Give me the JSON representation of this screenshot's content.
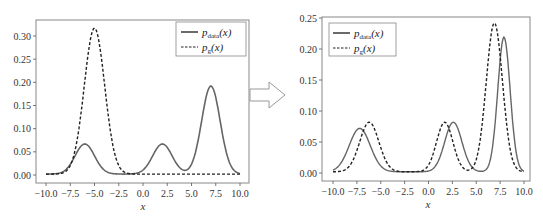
{
  "chart_data": [
    {
      "type": "line",
      "title": "",
      "xlabel": "x",
      "ylabel": "",
      "xlim": [
        -10.0,
        10.0
      ],
      "ylim": [
        0.0,
        0.3
      ],
      "xticks": [
        "-10.0",
        "-7.5",
        "-5.0",
        "-2.5",
        "0.0",
        "2.5",
        "5.0",
        "7.5",
        "10.0"
      ],
      "yticks": [
        "0.00",
        "0.05",
        "0.10",
        "0.15",
        "0.20",
        "0.25",
        "0.30"
      ],
      "grid": false,
      "legend_position": "upper right",
      "series": [
        {
          "name": "p_data(x)",
          "style": "solid",
          "color": "#555555",
          "components": [
            {
              "mean": -6.0,
              "peak": 0.065
            },
            {
              "mean": 2.0,
              "peak": 0.065
            },
            {
              "mean": 7.0,
              "peak": 0.19
            }
          ],
          "sample_points": [
            [
              -10,
              0
            ],
            [
              -7.5,
              0.02
            ],
            [
              -6,
              0.065
            ],
            [
              -4,
              0.01
            ],
            [
              -2.5,
              0.0
            ],
            [
              0,
              0.005
            ],
            [
              2,
              0.065
            ],
            [
              4.2,
              0.013
            ],
            [
              7,
              0.19
            ],
            [
              10,
              0.003
            ]
          ]
        },
        {
          "name": "p_g(x)",
          "style": "dashed",
          "color": "#222222",
          "components": [
            {
              "mean": -5.0,
              "peak": 0.315
            }
          ],
          "sample_points": [
            [
              -10,
              0
            ],
            [
              -7.5,
              0.03
            ],
            [
              -5,
              0.315
            ],
            [
              -2.5,
              0.02
            ],
            [
              -1.5,
              0.003
            ],
            [
              0,
              0.003
            ],
            [
              10,
              0.003
            ]
          ]
        }
      ]
    },
    {
      "type": "line",
      "title": "",
      "xlabel": "x",
      "ylabel": "",
      "xlim": [
        -10.0,
        10.0
      ],
      "ylim": [
        0.0,
        0.25
      ],
      "xticks": [
        "-10.0",
        "-7.5",
        "-5.0",
        "-2.5",
        "0.0",
        "2.5",
        "5.0",
        "7.5",
        "10.0"
      ],
      "yticks": [
        "0.00",
        "0.05",
        "0.10",
        "0.15",
        "0.20",
        "0.25"
      ],
      "grid": false,
      "legend_position": "upper left",
      "series": [
        {
          "name": "p_data(x)",
          "style": "solid",
          "color": "#555555",
          "components": [
            {
              "mean": -7.2,
              "peak": 0.07
            },
            {
              "mean": 2.6,
              "peak": 0.08
            },
            {
              "mean": 7.9,
              "peak": 0.217
            }
          ],
          "sample_points": [
            [
              -10,
              0
            ],
            [
              -7.2,
              0.07
            ],
            [
              -5,
              0.025
            ],
            [
              -2.5,
              0.0
            ],
            [
              0,
              0.005
            ],
            [
              2.6,
              0.08
            ],
            [
              5,
              0.013
            ],
            [
              7.9,
              0.217
            ],
            [
              10,
              0.003
            ]
          ]
        },
        {
          "name": "p_g(x)",
          "style": "dashed",
          "color": "#222222",
          "components": [
            {
              "mean": -6.2,
              "peak": 0.08
            },
            {
              "mean": 1.7,
              "peak": 0.08
            },
            {
              "mean": 6.9,
              "peak": 0.24
            }
          ],
          "sample_points": [
            [
              -10,
              0
            ],
            [
              -6.2,
              0.08
            ],
            [
              -4,
              0.025
            ],
            [
              -2.5,
              0.0
            ],
            [
              1.7,
              0.08
            ],
            [
              4.5,
              0.013
            ],
            [
              6.9,
              0.24
            ],
            [
              10,
              0.003
            ]
          ]
        }
      ]
    }
  ],
  "left_chart": {
    "legend": {
      "data_label": "p",
      "data_sub": "data",
      "g_label": "p",
      "g_sub": "g",
      "arg": "(x)"
    },
    "xlabel": "x"
  },
  "right_chart": {
    "legend": {
      "data_label": "p",
      "data_sub": "data",
      "g_label": "p",
      "g_sub": "g",
      "arg": "(x)"
    },
    "xlabel": "x"
  },
  "arrow": {
    "icon": "right-arrow-icon"
  }
}
